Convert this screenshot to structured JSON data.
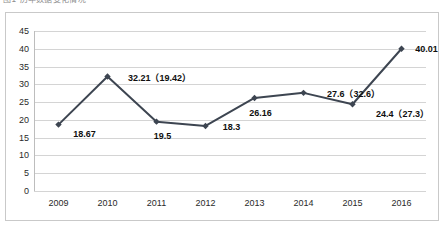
{
  "caption": {
    "text": "图1  历年数据变化情况"
  },
  "chart_data": {
    "type": "line",
    "title": "",
    "xlabel": "",
    "ylabel": "",
    "categories": [
      "2009",
      "2010",
      "2011",
      "2012",
      "2013",
      "2014",
      "2015",
      "2016"
    ],
    "values": [
      18.67,
      32.21,
      19.5,
      18.3,
      26.16,
      27.6,
      24.4,
      40.01
    ],
    "point_labels": [
      "18.67",
      "32.21（19.42）",
      "19.5",
      "18.3",
      "26.16",
      "27.6（32.6）",
      "24.4（27.3）",
      "40.01"
    ],
    "secondary_values": [
      null,
      19.42,
      null,
      null,
      null,
      32.6,
      27.3,
      null
    ],
    "ylim": [
      0,
      45
    ],
    "ytick_step": 5,
    "yticks": [
      "45",
      "40",
      "35",
      "30",
      "25",
      "20",
      "15",
      "10",
      "5",
      "0"
    ],
    "grid": true,
    "legend": "none",
    "series_color": "#3d4551",
    "marker": "diamond",
    "label_offsets": [
      {
        "dx": 26,
        "dy": 9
      },
      {
        "dx": 52,
        "dy": 1
      },
      {
        "dx": 6,
        "dy": 14
      },
      {
        "dx": 26,
        "dy": 1
      },
      {
        "dx": 6,
        "dy": 15
      },
      {
        "dx": 50,
        "dy": 0
      },
      {
        "dx": 50,
        "dy": 9
      },
      {
        "dx": 25,
        "dy": 0
      }
    ]
  },
  "colors": {
    "frame": "#c9c9c9",
    "grid": "#d4d4d4",
    "axis": "#bdbdbd",
    "text": "#2a2a2a",
    "series": "#3d4551"
  }
}
